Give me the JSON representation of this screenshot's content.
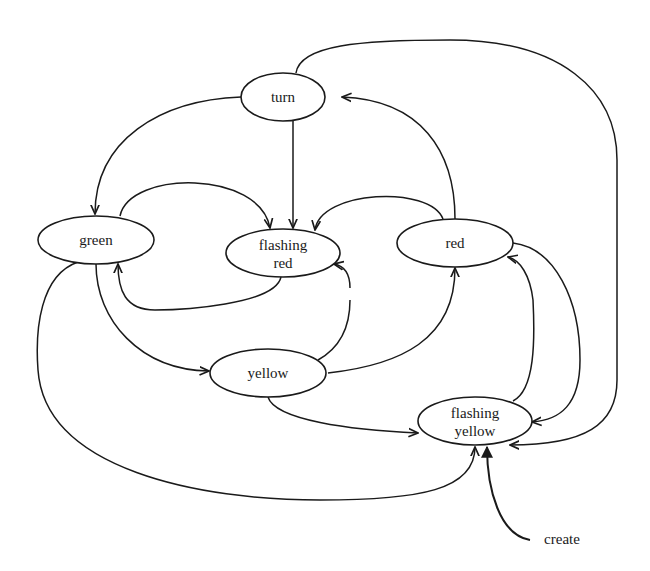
{
  "diagram": {
    "type": "state-transition-diagram",
    "nodes": [
      {
        "id": "turn",
        "lines": [
          "turn"
        ]
      },
      {
        "id": "green",
        "lines": [
          "green"
        ]
      },
      {
        "id": "flashing_red",
        "lines": [
          "flashing",
          "red"
        ]
      },
      {
        "id": "red",
        "lines": [
          "red"
        ]
      },
      {
        "id": "yellow",
        "lines": [
          "yellow"
        ]
      },
      {
        "id": "flashing_yellow",
        "lines": [
          "flashing",
          "yellow"
        ]
      }
    ],
    "labels": {
      "create": "create"
    },
    "edges": [
      {
        "from": "turn",
        "to": "green"
      },
      {
        "from": "turn",
        "to": "flashing_red"
      },
      {
        "from": "turn",
        "to": "flashing_yellow"
      },
      {
        "from": "green",
        "to": "flashing_red"
      },
      {
        "from": "green",
        "to": "yellow"
      },
      {
        "from": "green",
        "to": "flashing_yellow"
      },
      {
        "from": "flashing_red",
        "to": "green"
      },
      {
        "from": "red",
        "to": "turn"
      },
      {
        "from": "red",
        "to": "flashing_red"
      },
      {
        "from": "red",
        "to": "flashing_yellow"
      },
      {
        "from": "yellow",
        "to": "flashing_red"
      },
      {
        "from": "yellow",
        "to": "red"
      },
      {
        "from": "yellow",
        "to": "flashing_yellow"
      },
      {
        "from": "flashing_yellow",
        "to": "red"
      },
      {
        "from": "create",
        "to": "flashing_yellow"
      }
    ],
    "colors": {
      "stroke": "#1a1a1a",
      "background": "#ffffff"
    }
  }
}
